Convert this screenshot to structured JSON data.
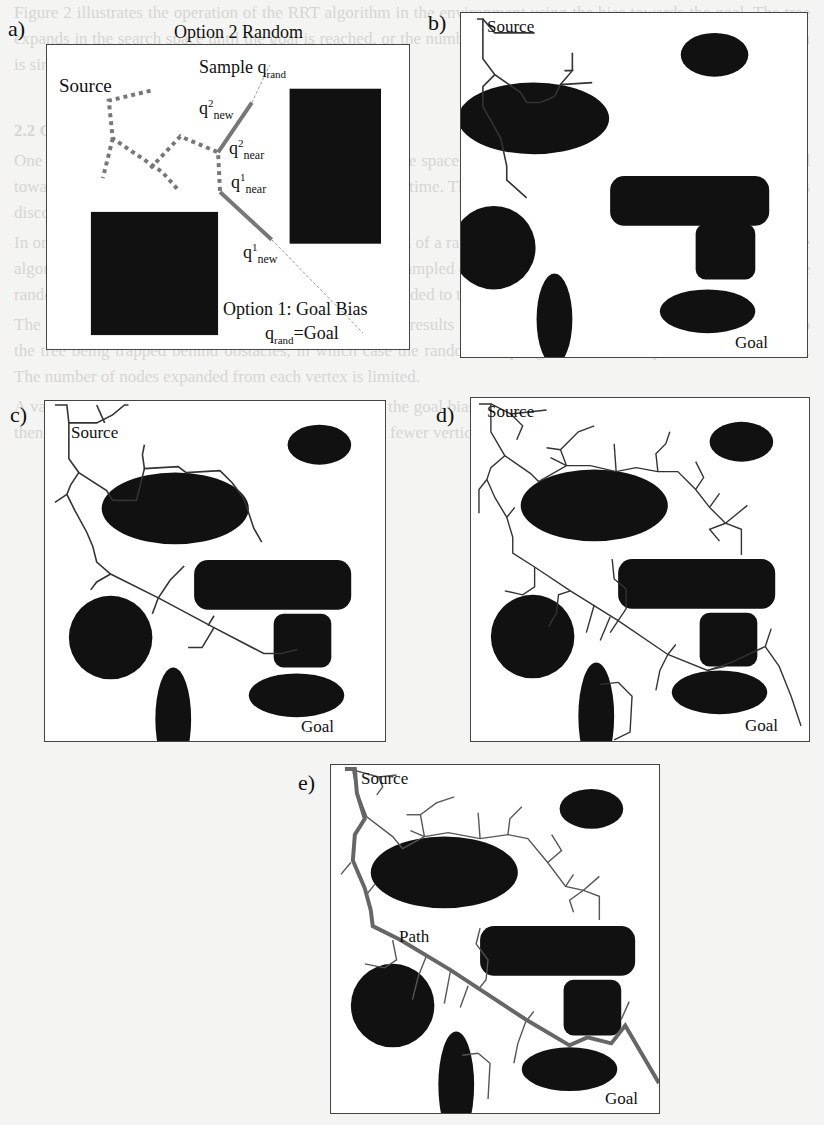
{
  "figure": {
    "panels": [
      {
        "id": "a",
        "label": "a)"
      },
      {
        "id": "b",
        "label": "b)"
      },
      {
        "id": "c",
        "label": "c)"
      },
      {
        "id": "d",
        "label": "d)"
      },
      {
        "id": "e",
        "label": "e)"
      }
    ],
    "panel_a": {
      "top_title": "Option 2 Random",
      "sample_label": "Sample q",
      "sample_sub": "rand",
      "source": "Source",
      "q2new_base": "q",
      "q2new_sup": "2",
      "q2new_sub": "new",
      "q2near_base": "q",
      "q2near_sup": "2",
      "q2near_sub": "near",
      "q1near_base": "q",
      "q1near_sup": "1",
      "q1near_sub": "near",
      "q1new_base": "q",
      "q1new_sup": "1",
      "q1new_sub": "new",
      "goal_bias": "Option 1: Goal Bias",
      "qrand_goal_base": "q",
      "qrand_goal_sub": "rand",
      "qrand_goal_rest": "=Goal"
    },
    "panel_b": {
      "source": "Source",
      "goal": "Goal"
    },
    "panel_c": {
      "source": "Source",
      "goal": "Goal"
    },
    "panel_d": {
      "source": "Source",
      "goal": "Goal"
    },
    "panel_e": {
      "source": "Source",
      "goal": "Goal",
      "path": "Path"
    }
  },
  "background_text": {
    "paragraphs": [
      "Figure 2 illustrates the operation of the RRT algorithm in the environment using the bias towards the goal. The tree expands in the search space until the goal is reached, or the number of vertices exceeds a limit. Hence the algorithm is simulated and the path is recorded for each run.",
      "2.2 Goal Biased RRT",
      "One problem with the algorithm is that it explores the free space uniformly in all directions. The search is extended towards the goal, which significantly increases the search time. The tree grows towards the goal, and once the goal is discovered the search is stopped.",
      "In order to grow towards the goal, sample the goal instead of a random configuration in the configuration space. The algorithm then selects the nearest node in the tree to the sampled configuration and extends it towards the goal or the random sample. If the new node is free of collision it is added to the tree.",
      "The growth of the tree is biased towards the goal, which results in a faster convergence. However, this may lead to the tree being trapped behind obstacles, in which case the random sampling is used to escape the local minimum. The number of nodes expanded from each vertex is limited.",
      "A variation of the algorithm has been proposed where the goal bias is applied to the nearest node. The path found is then smoothed and returned to the planner, resulting in fewer vertices and shorter overall path length."
    ]
  }
}
